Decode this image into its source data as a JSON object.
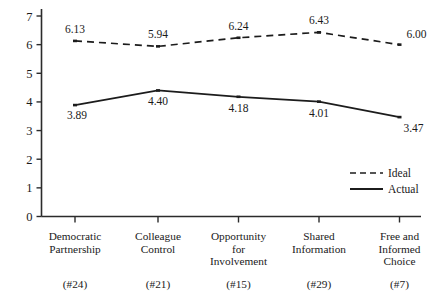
{
  "chart_data": {
    "type": "line",
    "title": "",
    "subtitle": "",
    "xlabel": "",
    "ylabel": "",
    "ylim": [
      0,
      7
    ],
    "yticks": [
      0,
      1,
      2,
      3,
      4,
      5,
      6,
      7
    ],
    "ytick_labels": [
      "0",
      "1",
      "2",
      "3",
      "4",
      "5",
      "6",
      "7"
    ],
    "grid": false,
    "legend_position": "inside-bottom-right",
    "categories": [
      "Democratic Partnership",
      "Colleague Control",
      "Opportunity for Involvement",
      "Shared Information",
      "Free and Informed Choice"
    ],
    "category_lines": [
      [
        "Democratic",
        "Partnership"
      ],
      [
        "Colleague",
        "Control"
      ],
      [
        "Opportunity",
        "for",
        "Involvement"
      ],
      [
        "Shared",
        "Information"
      ],
      [
        "Free and",
        "Informed",
        "Choice"
      ]
    ],
    "category_counts": [
      "(#24)",
      "(#21)",
      "(#15)",
      "(#29)",
      "(#7)"
    ],
    "series": [
      {
        "name": "Ideal",
        "style": "dashed",
        "color": "#1c1c1c",
        "values": [
          6.13,
          5.94,
          6.24,
          6.43,
          6.0
        ],
        "labels": [
          "6.13",
          "5.94",
          "6.24",
          "6.43",
          "6.00"
        ]
      },
      {
        "name": "Actual",
        "style": "solid",
        "color": "#1c1c1c",
        "values": [
          3.89,
          4.4,
          4.18,
          4.01,
          3.47
        ],
        "labels": [
          "3.89",
          "4.40",
          "4.18",
          "4.01",
          "3.47"
        ]
      }
    ]
  },
  "legend": {
    "items": [
      {
        "label": "Ideal",
        "style": "dashed"
      },
      {
        "label": "Actual",
        "style": "solid"
      }
    ]
  },
  "colors": {
    "axis": "#2b2b2b",
    "series": "#1c1c1c",
    "background": "#ffffff"
  }
}
